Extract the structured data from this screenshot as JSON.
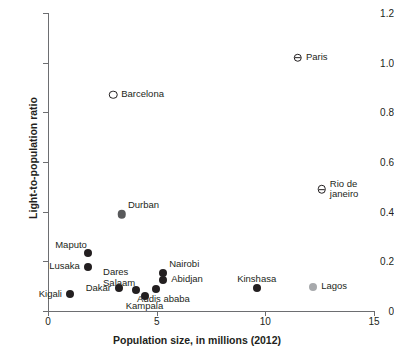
{
  "chart_data": {
    "type": "scatter",
    "title": "",
    "xlabel": "Population size, in millions (2012)",
    "ylabel": "Light-to-population ratio",
    "xlim": [
      0,
      15
    ],
    "ylim": [
      0,
      1.2
    ],
    "xticks": [
      "0",
      "5",
      "10",
      "15"
    ],
    "xtick_values": [
      0,
      5,
      10,
      15
    ],
    "yticks": [
      "0",
      "0.2",
      "0.4",
      "0.6",
      "0.8",
      "1.0",
      "1.2"
    ],
    "ytick_values": [
      0,
      0.2,
      0.4,
      0.6,
      0.8,
      1.0,
      1.2
    ],
    "grid": false,
    "legend": "none",
    "points": [
      {
        "label": "Paris",
        "x": 11.5,
        "y": 1.02,
        "marker": "barred",
        "label_pos": "right"
      },
      {
        "label": "Barcelona",
        "x": 3.0,
        "y": 0.87,
        "marker": "hollow",
        "label_pos": "right"
      },
      {
        "label": "Rio de\njaneiro",
        "x": 12.6,
        "y": 0.49,
        "marker": "barred",
        "label_pos": "right"
      },
      {
        "label": "Durban",
        "x": 3.4,
        "y": 0.39,
        "marker": "filled-gray",
        "label_pos": "upper-right"
      },
      {
        "label": "Maputo",
        "x": 1.85,
        "y": 0.235,
        "marker": "filled-dark",
        "label_pos": "upper-left"
      },
      {
        "label": "Lusaka",
        "x": 1.85,
        "y": 0.178,
        "marker": "filled-dark",
        "label_pos": "left"
      },
      {
        "label": "Dakar",
        "x": 3.25,
        "y": 0.092,
        "marker": "filled-dark",
        "label_pos": "left"
      },
      {
        "label": "Kigali",
        "x": 1.0,
        "y": 0.068,
        "marker": "filled-dark",
        "label_pos": "left"
      },
      {
        "label": "Dares\nSalaam",
        "x": 4.05,
        "y": 0.085,
        "marker": "filled-dark",
        "label_pos": "upper-left"
      },
      {
        "label": "Kampala",
        "x": 4.45,
        "y": 0.06,
        "marker": "filled-dark",
        "label_pos": "below"
      },
      {
        "label": "Addis ababa",
        "x": 4.95,
        "y": 0.09,
        "marker": "filled-dark",
        "label_pos": "below-right"
      },
      {
        "label": "Abidjan",
        "x": 5.3,
        "y": 0.125,
        "marker": "filled-dark",
        "label_pos": "right"
      },
      {
        "label": "Nairobi",
        "x": 5.3,
        "y": 0.155,
        "marker": "filled-dark",
        "label_pos": "upper-right"
      },
      {
        "label": "Kinshasa",
        "x": 9.6,
        "y": 0.093,
        "marker": "filled-dark",
        "label_pos": "upper"
      },
      {
        "label": "Lagos",
        "x": 12.2,
        "y": 0.098,
        "marker": "filled-lightgray",
        "label_pos": "right"
      }
    ]
  },
  "labels": {
    "paris": "Paris",
    "barcelona": "Barcelona",
    "rio": "Rio de\njaneiro",
    "durban": "Durban",
    "maputo": "Maputo",
    "lusaka": "Lusaka",
    "dares": "Dares",
    "salaam": "Salaam",
    "dakar": "Dakar",
    "kigali": "Kigali",
    "kampala": "Kampala",
    "addis": "Addis ababa",
    "abidjan": "Abidjan",
    "nairobi": "Nairobi",
    "kinshasa": "Kinshasa",
    "lagos": "Lagos"
  }
}
